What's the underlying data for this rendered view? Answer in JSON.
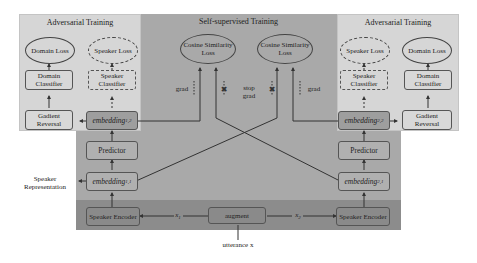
{
  "regions": {
    "left_adversarial": {
      "title": "Adversarial Training"
    },
    "self_supervised": {
      "title": "Self-supervised Training"
    },
    "right_adversarial": {
      "title": "Adversarial Training"
    }
  },
  "left": {
    "domain_loss": "Domain Loss",
    "speaker_loss": "Speaker Loss",
    "domain_classifier": "Domain Classifier",
    "speaker_classifier": "Speaker Classifier",
    "gradient_reversal": "Gadient Reversal",
    "embedding_12": {
      "base": "embedding",
      "sub": "1,2"
    },
    "predictor": "Predictor",
    "embedding_11": {
      "base": "embedding",
      "sub": "1,1"
    },
    "speaker_encoder": "Speaker Encoder"
  },
  "right": {
    "domain_loss": "Domain Loss",
    "speaker_loss": "Speaker Loss",
    "domain_classifier": "Domain Classifier",
    "speaker_classifier": "Speaker Classifier",
    "gradient_reversal": "Gadient Reversal",
    "embedding_22": {
      "base": "embedding",
      "sub": "2,2"
    },
    "predictor": "Predictor",
    "embedding_21": {
      "base": "embedding",
      "sub": "2,1"
    },
    "speaker_encoder": "Speaker Encoder"
  },
  "center": {
    "cosine_loss_left": "Cosine Similarity Loss",
    "cosine_loss_right": "Cosine Similarity Loss",
    "grad_left": "grad",
    "grad_right": "grad",
    "stop_grad": "stop grad",
    "augment": "augment",
    "x1": {
      "base": "x",
      "sub": "1"
    },
    "x2": {
      "base": "x",
      "sub": "2"
    }
  },
  "external": {
    "speaker_representation": "Speaker Representation",
    "utterance": "utterance x"
  },
  "colors": {
    "adversarial_bg": "#d6d6d6",
    "self_supervised_bg": "#a9a9a9",
    "encoder_band_bg": "#8c8c8c",
    "line": "#333333"
  }
}
